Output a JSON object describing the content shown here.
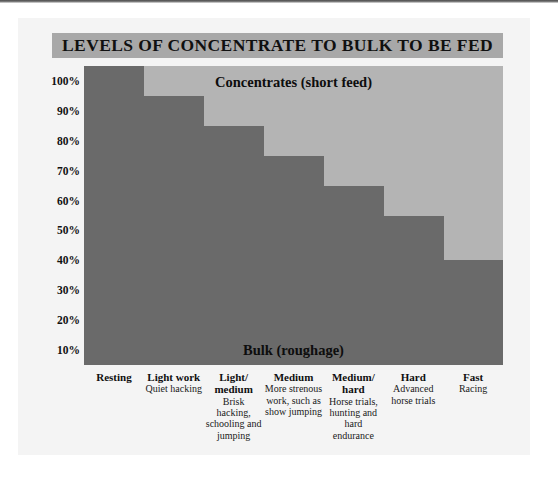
{
  "header": {
    "title": "LEVELS OF CONCENTRATE TO BULK TO BE FED",
    "title_band_color": "#a8a8a8"
  },
  "colors": {
    "page_background": "#f4f4f4",
    "bulk": "#6a6a6a",
    "concentrates": "#b4b4b4",
    "text": "#101010"
  },
  "chart_data": {
    "type": "area",
    "title": "LEVELS OF CONCENTRATE TO BULK TO BE FED",
    "subtitle": "",
    "xlabel": "",
    "ylabel": "",
    "ylim": [
      0,
      100
    ],
    "grid": false,
    "legend_position": "in-plot",
    "ytick_labels": [
      "100%",
      "90%",
      "80%",
      "70%",
      "60%",
      "50%",
      "40%",
      "30%",
      "20%",
      "10%"
    ],
    "ytick_values": [
      100,
      90,
      80,
      70,
      60,
      50,
      40,
      30,
      20,
      10
    ],
    "annotations": [
      {
        "name": "concentrates-label",
        "text": "Concentrates (short feed)",
        "area": "upper"
      },
      {
        "name": "bulk-label",
        "text": "Bulk (roughage)",
        "area": "lower"
      }
    ],
    "categories": [
      "Resting",
      "Light work",
      "Light/ medium",
      "Medium",
      "Medium/ hard",
      "Hard",
      "Fast"
    ],
    "series": [
      {
        "name": "Bulk (roughage)",
        "values": [
          100,
          90,
          80,
          70,
          60,
          50,
          35
        ]
      },
      {
        "name": "Concentrates (short feed)",
        "values": [
          0,
          10,
          20,
          30,
          40,
          50,
          65
        ]
      }
    ],
    "columns": [
      {
        "head": "Resting",
        "sub": "",
        "bulk": 100,
        "concentrates": 0
      },
      {
        "head": "Light work",
        "sub": "Quiet hacking",
        "bulk": 90,
        "concentrates": 10
      },
      {
        "head": "Light/ medium",
        "sub": "Brisk hacking, schooling and jumping",
        "bulk": 80,
        "concentrates": 20
      },
      {
        "head": "Medium",
        "sub": "More strenous work, such as show jumping",
        "bulk": 70,
        "concentrates": 30
      },
      {
        "head": "Medium/ hard",
        "sub": "Horse trials, hunting and hard endurance",
        "bulk": 60,
        "concentrates": 40
      },
      {
        "head": "Hard",
        "sub": "Advanced horse trials",
        "bulk": 50,
        "concentrates": 50
      },
      {
        "head": "Fast",
        "sub": "Racing",
        "bulk": 35,
        "concentrates": 65
      }
    ]
  }
}
